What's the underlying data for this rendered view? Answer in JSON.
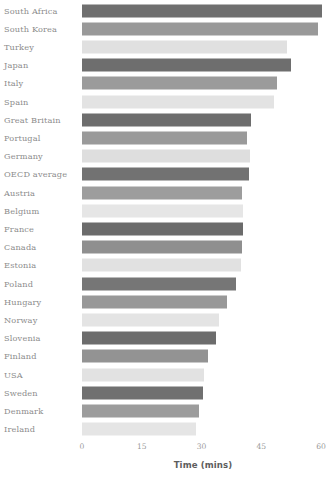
{
  "chart_data": {
    "type": "bar",
    "orientation": "horizontal",
    "title": "",
    "subtitle": "",
    "xlabel": "Time (mins)",
    "ylabel": "",
    "xlim": [
      0,
      62
    ],
    "xticks": [
      0,
      15,
      30,
      45,
      60
    ],
    "xtick_labels": [
      "0",
      "15",
      "30",
      "45",
      "60"
    ],
    "grid": false,
    "legend": "none",
    "categories": [
      "South Africa",
      "South Korea",
      "Turkey",
      "Japan",
      "Italy",
      "Spain",
      "Great Britain",
      "Portugal",
      "Germany",
      "OECD average",
      "Austria",
      "Belgium",
      "France",
      "Canada",
      "Estonia",
      "Poland",
      "Hungary",
      "Norway",
      "Slovenia",
      "Finland",
      "USA",
      "Sweden",
      "Denmark",
      "Ireland"
    ],
    "values": [
      60.3,
      59.3,
      51.5,
      52.5,
      49.0,
      48.2,
      42.5,
      41.5,
      42.2,
      42.0,
      40.2,
      40.5,
      40.5,
      40.2,
      40.0,
      38.7,
      36.4,
      34.4,
      33.7,
      31.7,
      30.7,
      30.4,
      29.4,
      28.6
    ],
    "bar_colors": [
      "#6f6f6f",
      "#999999",
      "#e0e0e0",
      "#6e6e6e",
      "#9b9b9b",
      "#e3e3e3",
      "#6d6d6d",
      "#9a9a9a",
      "#dedede",
      "#727272",
      "#9d9d9d",
      "#e6e6e6",
      "#6b6b6b",
      "#8f8f8f",
      "#e1e1e1",
      "#767676",
      "#989898",
      "#e4e4e4",
      "#6c6c6c",
      "#939393",
      "#e2e2e2",
      "#707070",
      "#9c9c9c",
      "#e5e5e5"
    ],
    "axis_color": "#9a9a9a",
    "label_color": "#8c8c8c",
    "background": "#ffffff"
  }
}
